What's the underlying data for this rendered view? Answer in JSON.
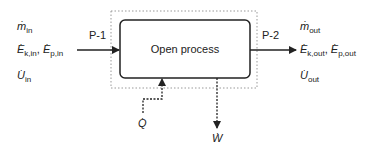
{
  "diagram": {
    "type": "open-process-control-volume",
    "process_label": "Open process",
    "inlet": {
      "port_label": "P-1",
      "streams": [
        {
          "symbol": "m",
          "sub": "in"
        },
        {
          "symbol": "E",
          "sub": "k,in",
          "symbol2": "E",
          "sub2": "p,in"
        },
        {
          "symbol": "U",
          "sub": "in"
        }
      ]
    },
    "outlet": {
      "port_label": "P-2",
      "streams": [
        {
          "symbol": "m",
          "sub": "out"
        },
        {
          "symbol": "E",
          "sub": "k,out",
          "symbol2": "E",
          "sub2": "p,out"
        },
        {
          "symbol": "U",
          "sub": "out"
        }
      ]
    },
    "heat": {
      "symbol": "Q",
      "direction": "in"
    },
    "work": {
      "symbol": "W",
      "direction": "out"
    },
    "colors": {
      "line": "#222222",
      "boundary": "#999999"
    }
  }
}
